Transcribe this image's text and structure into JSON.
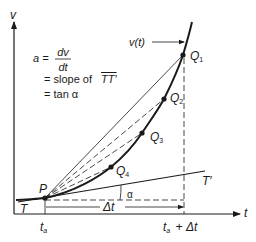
{
  "axes": {
    "y_label": "v",
    "x_label": "t"
  },
  "formula": {
    "lhs": "a =",
    "numerator": "dv",
    "denominator": "dt",
    "line2_prefix": "= slope of",
    "line2_segment": "TT′",
    "line3": "= tan α"
  },
  "curve_label": "v(t)",
  "points": {
    "P": "P",
    "Q1": "Q",
    "Q2": "Q",
    "Q3": "Q",
    "Q4": "Q",
    "Q1_sub": "1",
    "Q2_sub": "2",
    "Q3_sub": "3",
    "Q4_sub": "4"
  },
  "tangent": {
    "start": "T",
    "end": "T′"
  },
  "angle_label": "α",
  "interval_label": "Δt",
  "ticks": {
    "start": "t",
    "start_sub": "a",
    "end_prefix": "t",
    "end_sub": "a",
    "end_suffix": "+ Δt"
  },
  "colors": {
    "ink": "#1a1a1a",
    "background": "#ffffff"
  }
}
